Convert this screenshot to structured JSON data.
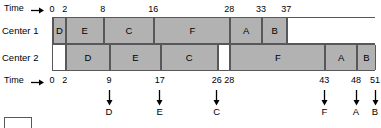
{
  "chart_data": {
    "type": "bar",
    "title": "",
    "subtitle": "",
    "orientation": "horizontal",
    "xlabel": "Time",
    "ylabel": "",
    "xlim": [
      0,
      51
    ],
    "grid": false,
    "legend": false,
    "categories": [
      "Center 1",
      "Center 2"
    ],
    "time_unit_px": 6.333,
    "series": [
      {
        "name": "Center 1",
        "blocks": [
          {
            "label": "D",
            "start": 0,
            "end": 2,
            "busy": true
          },
          {
            "label": "E",
            "start": 2,
            "end": 8,
            "busy": true
          },
          {
            "label": "C",
            "start": 8,
            "end": 16,
            "busy": true
          },
          {
            "label": "F",
            "start": 16,
            "end": 28,
            "busy": true
          },
          {
            "label": "A",
            "start": 28,
            "end": 33,
            "busy": true
          },
          {
            "label": "B",
            "start": 33,
            "end": 37,
            "busy": true
          },
          {
            "label": "",
            "start": 37,
            "end": 51,
            "busy": false
          }
        ]
      },
      {
        "name": "Center 2",
        "blocks": [
          {
            "label": "",
            "start": 0,
            "end": 2,
            "busy": false
          },
          {
            "label": "D",
            "start": 2,
            "end": 9,
            "busy": true
          },
          {
            "label": "E",
            "start": 9,
            "end": 17,
            "busy": true
          },
          {
            "label": "C",
            "start": 17,
            "end": 26,
            "busy": true
          },
          {
            "label": "",
            "start": 26,
            "end": 28,
            "busy": false
          },
          {
            "label": "F",
            "start": 28,
            "end": 43,
            "busy": true
          },
          {
            "label": "A",
            "start": 43,
            "end": 48,
            "busy": true
          },
          {
            "label": "B",
            "start": 48,
            "end": 51,
            "busy": true
          }
        ]
      }
    ],
    "top_axis": {
      "caption": "Time",
      "arrow": "right-arrow-icon",
      "ticks": [
        0,
        2,
        8,
        16,
        28,
        33,
        37
      ]
    },
    "bottom_axis": {
      "caption": "Time",
      "arrow": "right-arrow-icon",
      "ticks": [
        0,
        2,
        9,
        17,
        26,
        28,
        43,
        48,
        51
      ]
    },
    "completions": [
      {
        "label": "D",
        "time": 9
      },
      {
        "label": "E",
        "time": 17
      },
      {
        "label": "C",
        "time": 26
      },
      {
        "label": "F",
        "time": 43
      },
      {
        "label": "A",
        "time": 48
      },
      {
        "label": "B",
        "time": 51
      }
    ],
    "colors": {
      "busy_fill": "#b2b2b2",
      "idle_fill": "#ffffff",
      "stroke": "#58585a",
      "text": "#000000",
      "background": "#ffffff"
    }
  }
}
